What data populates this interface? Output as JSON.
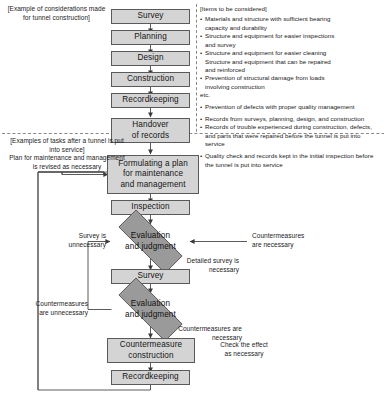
{
  "diagram": {
    "title_note_top_left": "[Example of considerations made for tunnel construction]",
    "note_service": "[Examples of tasks after a tunnel is put into service]",
    "note_plan_revised": "Plan for maintenance and management is revised as necessary"
  },
  "nodes": {
    "survey_top": "Survey",
    "planning": "Planning",
    "design": "Design",
    "construction": "Construction",
    "recordkeeping_top": "Recordkeeping",
    "handover": "Handover\nof records",
    "handover_l1": "Handover",
    "handover_l2": "of records",
    "formulating_l1": "Formulating a plan",
    "formulating_l2": "for maintenance",
    "formulating_l3": "and management",
    "inspection": "Inspection",
    "evaluation1_l1": "Evaluation",
    "evaluation1_l2": "and judgment",
    "survey_mid": "Survey",
    "evaluation2_l1": "Evaluation",
    "evaluation2_l2": "and judgment",
    "countermeasure_l1": "Countermeasure",
    "countermeasure_l2": "construction",
    "recordkeeping_bottom": "Recordkeeping"
  },
  "edge_labels": {
    "survey_unnecessary": "Survey is\nunnecessary",
    "survey_unnecessary_l1": "Survey is",
    "survey_unnecessary_l2": "unnecessary",
    "countermeasures_necessary_right_l1": "Countermeasures",
    "countermeasures_necessary_right_l2": "are necessary",
    "detailed_survey_l1": "Detailed survey is",
    "detailed_survey_l2": "necessary",
    "countermeasures_unnecessary_l1": "Countermeasures",
    "countermeasures_unnecessary_l2": "are unnecessary",
    "countermeasures_necessary_mid_l1": "Countermeasures are",
    "countermeasures_necessary_mid_l2": "necessary",
    "check_effect_l1": "Check the effect",
    "check_effect_l2": "as necessary"
  },
  "items_panel": {
    "header": "[Items to be considered]",
    "items": [
      "Materials and structure with sufficient bearing capacity and durability",
      "Structure and equipment for easier inspections and survey",
      "Structure and equipment for easier cleaning Structure and equipment that can be repaired and reinforced",
      "Prevention of structural damage from loads involving construction",
      "etc.",
      "Prevention of defects with proper quality management",
      "Records from surveys, planning, design, and construction",
      "Records of trouble experienced during construction, defects, and parts that were repaired before the tunnel is put into service",
      "Quality check and records kept in the initial inspection before the tunnel is put into service"
    ],
    "lines": [
      {
        "bullet": true,
        "text": "Materials and structure with sufficient bearing"
      },
      {
        "bullet": false,
        "text": "capacity and durability"
      },
      {
        "bullet": true,
        "text": "Structure and equipment for easier inspections"
      },
      {
        "bullet": false,
        "text": "and survey"
      },
      {
        "bullet": true,
        "text": "Structure and equipment for easier cleaning"
      },
      {
        "bullet": false,
        "text": "Structure and equipment that can be repaired"
      },
      {
        "bullet": false,
        "text": "and reinforced"
      },
      {
        "bullet": true,
        "text": "Prevention of structural damage from loads"
      },
      {
        "bullet": false,
        "text": "involving construction"
      },
      {
        "bullet": false,
        "text": "etc."
      },
      {
        "bullet": true,
        "text": "Prevention of defects with proper quality management",
        "gap": true
      },
      {
        "bullet": true,
        "text": "Records from surveys, planning, design, and construction",
        "gap": true
      },
      {
        "bullet": true,
        "text": "Records of trouble experienced during construction, defects,"
      },
      {
        "bullet": false,
        "text": "and parts that were repaired before the tunnel is put into"
      },
      {
        "bullet": false,
        "text": "service"
      },
      {
        "bullet": true,
        "text": "Quality check and records kept in the initial inspection before"
      },
      {
        "bullet": false,
        "text": "the tunnel is put into service"
      }
    ]
  },
  "colors": {
    "box_fill": "#d4d4d4",
    "diamond_fill": "#9a9a9a",
    "stroke": "#4a4a4a",
    "text": "#141414",
    "background": "#ffffff"
  }
}
